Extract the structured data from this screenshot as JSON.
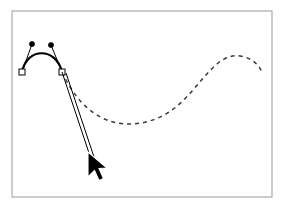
{
  "figure": {
    "canvas": {
      "width": 284,
      "height": 208,
      "background_color": "#ffffff"
    },
    "frame": {
      "x": 12,
      "y": 11,
      "width": 260,
      "height": 186,
      "stroke_color": "#9a9a9a",
      "stroke_width": 1,
      "fill_color": "#ffffff"
    },
    "solid_curve": {
      "label": "drawn-bezier-arc",
      "stroke_color": "#000000",
      "stroke_width": 2.2,
      "path": "M 22,72 C 27,47 56,47 62,72"
    },
    "dashed_curve": {
      "label": "preview-s-curve",
      "stroke_color": "#3a3a3a",
      "stroke_width": 1.5,
      "dash_pattern": "4 4",
      "path": "M 62,72 C 86,124 124,132 158,118 C 196,102 210,52 240,56 C 252,58 258,64 262,72"
    },
    "anchors": [
      {
        "label": "anchor-point-left",
        "x": 22,
        "y": 72,
        "size": 6,
        "fill_color": "#ffffff",
        "stroke_color": "#000000"
      },
      {
        "label": "anchor-point-right",
        "x": 62,
        "y": 72,
        "size": 6,
        "fill_color": "#ffffff",
        "stroke_color": "#000000"
      }
    ],
    "handles": [
      {
        "label": "control-handle-left",
        "line_from_x": 22,
        "line_from_y": 72,
        "dot_x": 32,
        "dot_y": 44,
        "dot_radius": 2.6,
        "stroke_color": "#000000",
        "fill_color": "#000000"
      },
      {
        "label": "control-handle-right",
        "line_from_x": 62,
        "line_from_y": 72,
        "dot_x": 51,
        "dot_y": 45,
        "dot_radius": 2.6,
        "stroke_color": "#000000",
        "fill_color": "#000000"
      }
    ],
    "drag_lines": [
      {
        "label": "drag-line-outer",
        "x1": 62,
        "y1": 72,
        "x2": 92,
        "y2": 162,
        "stroke_color": "#000000",
        "stroke_width": 1
      },
      {
        "label": "drag-line-inner",
        "x1": 66,
        "y1": 73,
        "x2": 95,
        "y2": 160,
        "stroke_color": "#000000",
        "stroke_width": 1
      }
    ],
    "cursor": {
      "label": "arrow-pointer",
      "tip_x": 88,
      "tip_y": 152,
      "fill_color": "#000000",
      "outline_color": "#ffffff",
      "points": "88,152 88,176 94,170 98,180 102,178 98,168 106,168"
    }
  }
}
